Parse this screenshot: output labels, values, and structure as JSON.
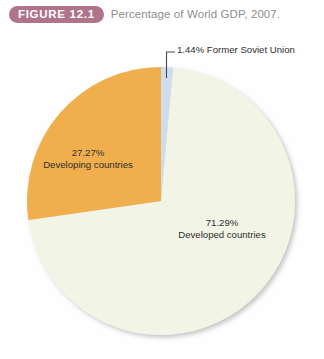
{
  "figure": {
    "badge_label": "FIGURE 12.1",
    "caption": "Percentage of World GDP, 2007.",
    "badge_color": "#b0748a",
    "caption_color": "#8e8e90"
  },
  "callouts": [
    {
      "name": "former-soviet-union",
      "text": "1.44% Former Soviet Union"
    }
  ],
  "labels": {
    "developing": {
      "percent": "27.27%",
      "name": "Developing countries"
    },
    "developed": {
      "percent": "71.29%",
      "name": "Developed countries"
    }
  },
  "chart_data": {
    "type": "pie",
    "title": "Percentage of World GDP, 2007.",
    "categories": [
      "Former Soviet Union",
      "Developed countries",
      "Developing countries"
    ],
    "values": [
      1.44,
      71.29,
      27.27
    ],
    "value_labels": [
      "1.44%",
      "71.29%",
      "27.27%"
    ],
    "colors": [
      "#cfdcec",
      "#f2f4e6",
      "#f0ae4e"
    ],
    "unit": "percent",
    "start_angle_deg": 0,
    "direction": "clockwise",
    "legend": "none",
    "annotations": [
      {
        "series": "Former Soviet Union",
        "text": "1.44% Former Soviet Union",
        "placement": "outside-leader-line"
      },
      {
        "series": "Developing countries",
        "text": "27.27% Developing countries",
        "placement": "inside"
      },
      {
        "series": "Developed countries",
        "text": "71.29% Developed countries",
        "placement": "inside"
      }
    ],
    "center": [
      161,
      201
    ],
    "radius": 134
  }
}
